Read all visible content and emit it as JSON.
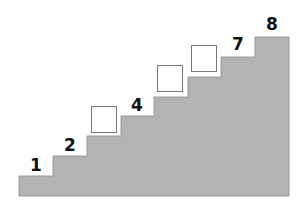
{
  "diagram": {
    "type": "staircase-number-sequence",
    "fill_color": "#b3b3b3",
    "edge_color": "#9a9a9a",
    "steps": [
      {
        "index": 1,
        "label": "1",
        "known": true
      },
      {
        "index": 2,
        "label": "2",
        "known": true
      },
      {
        "index": 3,
        "label": "",
        "known": false
      },
      {
        "index": 4,
        "label": "4",
        "known": true
      },
      {
        "index": 5,
        "label": "",
        "known": false
      },
      {
        "index": 6,
        "label": "",
        "known": false
      },
      {
        "index": 7,
        "label": "7",
        "known": true
      },
      {
        "index": 8,
        "label": "8",
        "known": true
      }
    ]
  }
}
